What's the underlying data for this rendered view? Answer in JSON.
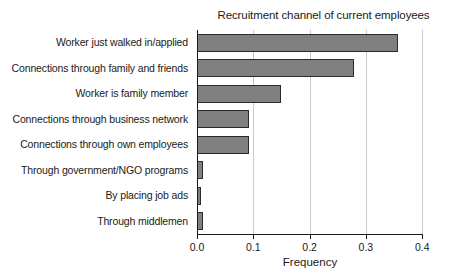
{
  "chart_data": {
    "type": "bar",
    "orientation": "horizontal",
    "title": "Recruitment channel of current employees",
    "xlabel": "Frequency",
    "ylabel": "",
    "xlim": [
      0.0,
      0.4
    ],
    "grid": true,
    "legend": null,
    "bar_color": "#808080",
    "bar_edge_color": "#2b2b2b",
    "categories": [
      "Worker just walked in/applied",
      "Connections through family and friends",
      "Worker is family member",
      "Connections through business network",
      "Connections through own employees",
      "Through government/NGO programs",
      "By placing job ads",
      "Through middlemen"
    ],
    "values": [
      0.357,
      0.279,
      0.149,
      0.092,
      0.092,
      0.011,
      0.007,
      0.011
    ],
    "xticks": [
      0.0,
      0.1,
      0.2,
      0.3,
      0.4
    ],
    "xtick_labels": [
      "0.0",
      "0.1",
      "0.2",
      "0.3",
      "0.4"
    ]
  }
}
